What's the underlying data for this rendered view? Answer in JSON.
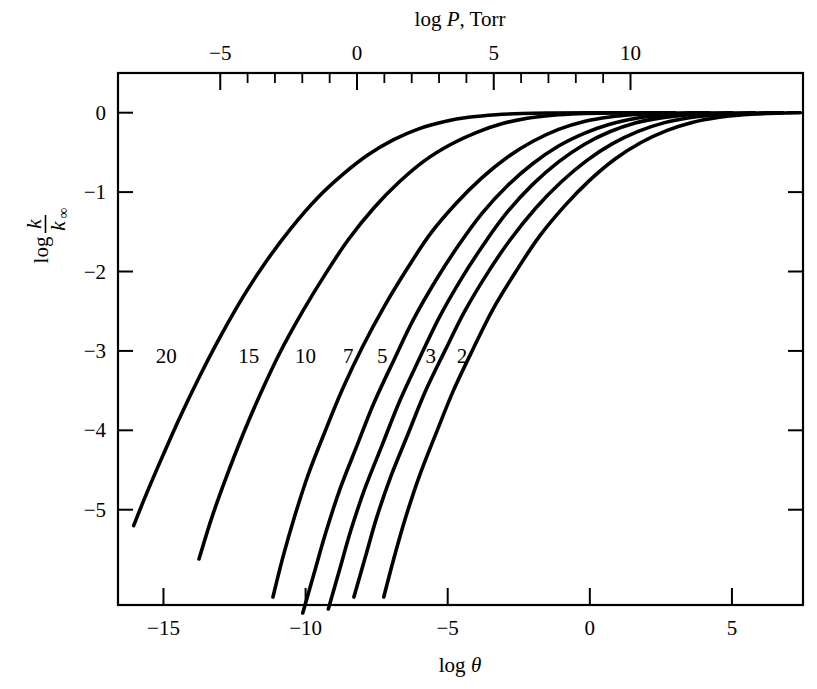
{
  "figure": {
    "background_color": "#ffffff",
    "ink_color": "#000000"
  },
  "chart_data": {
    "type": "line",
    "title": "",
    "xlabel": "log θ",
    "ylabel": "log k/k∞",
    "top_axis_label": "log P, Torr",
    "xlim": [
      -16.6,
      7.5
    ],
    "ylim": [
      -6.2,
      0.5
    ],
    "grid": false,
    "legend": "inline-curve-labels",
    "x_ticks": [
      {
        "value": -15,
        "label": "−15"
      },
      {
        "value": -10,
        "label": "−10"
      },
      {
        "value": -5,
        "label": "−5"
      },
      {
        "value": 0,
        "label": "0"
      },
      {
        "value": 5,
        "label": "5"
      }
    ],
    "y_ticks": [
      {
        "value": 0,
        "label": "0"
      },
      {
        "value": -1,
        "label": "−1"
      },
      {
        "value": -2,
        "label": "−2"
      },
      {
        "value": -3,
        "label": "−3"
      },
      {
        "value": -4,
        "label": "−4"
      },
      {
        "value": -5,
        "label": "−5"
      }
    ],
    "top_axis": {
      "label": "log P, Torr",
      "major_ticks": [
        {
          "value": -5,
          "label": "−5"
        },
        {
          "value": 0,
          "label": "0"
        },
        {
          "value": 5,
          "label": "5"
        },
        {
          "value": 10,
          "label": "10"
        }
      ],
      "minor_tick_count_between_majors": 4,
      "minor_ticks": [
        -4,
        -3,
        -2,
        -1,
        1,
        2,
        3,
        4,
        6,
        7,
        8,
        9
      ]
    },
    "series": [
      {
        "name": "20",
        "label": "20",
        "label_x": -14.9,
        "label_y": -3.15,
        "points": [
          [
            -16.05,
            -5.2
          ],
          [
            -15.6,
            -4.8
          ],
          [
            -15.0,
            -4.3
          ],
          [
            -14.4,
            -3.82
          ],
          [
            -13.7,
            -3.3
          ],
          [
            -13.0,
            -2.82
          ],
          [
            -12.2,
            -2.32
          ],
          [
            -11.4,
            -1.88
          ],
          [
            -10.5,
            -1.45
          ],
          [
            -9.6,
            -1.08
          ],
          [
            -8.7,
            -0.78
          ],
          [
            -7.8,
            -0.53
          ],
          [
            -6.9,
            -0.34
          ],
          [
            -6.0,
            -0.2
          ],
          [
            -5.1,
            -0.11
          ],
          [
            -4.2,
            -0.055
          ],
          [
            -3.3,
            -0.025
          ],
          [
            -2.4,
            -0.01
          ],
          [
            -1.5,
            -0.004
          ],
          [
            0.0,
            -0.001
          ],
          [
            3.0,
            0.0
          ]
        ]
      },
      {
        "name": "15",
        "label": "15",
        "label_x": -12.0,
        "label_y": -3.15,
        "points": [
          [
            -13.75,
            -5.62
          ],
          [
            -13.3,
            -5.1
          ],
          [
            -12.8,
            -4.6
          ],
          [
            -12.2,
            -4.05
          ],
          [
            -11.6,
            -3.55
          ],
          [
            -10.9,
            -3.02
          ],
          [
            -10.1,
            -2.5
          ],
          [
            -9.3,
            -2.03
          ],
          [
            -8.5,
            -1.6
          ],
          [
            -7.6,
            -1.2
          ],
          [
            -6.7,
            -0.87
          ],
          [
            -5.8,
            -0.6
          ],
          [
            -4.9,
            -0.4
          ],
          [
            -4.0,
            -0.25
          ],
          [
            -3.1,
            -0.14
          ],
          [
            -2.2,
            -0.07
          ],
          [
            -1.3,
            -0.032
          ],
          [
            -0.4,
            -0.013
          ],
          [
            0.8,
            -0.004
          ],
          [
            2.0,
            -0.001
          ],
          [
            3.0,
            0.0
          ]
        ]
      },
      {
        "name": "10",
        "label": "10",
        "label_x": -10.0,
        "label_y": -3.15,
        "points": [
          [
            -11.15,
            -6.1
          ],
          [
            -10.8,
            -5.6
          ],
          [
            -10.4,
            -5.1
          ],
          [
            -9.9,
            -4.55
          ],
          [
            -9.3,
            -4.0
          ],
          [
            -8.7,
            -3.48
          ],
          [
            -8.0,
            -2.95
          ],
          [
            -7.2,
            -2.42
          ],
          [
            -6.4,
            -1.95
          ],
          [
            -5.6,
            -1.52
          ],
          [
            -4.7,
            -1.14
          ],
          [
            -3.8,
            -0.82
          ],
          [
            -2.9,
            -0.56
          ],
          [
            -2.0,
            -0.36
          ],
          [
            -1.1,
            -0.21
          ],
          [
            -0.2,
            -0.11
          ],
          [
            0.7,
            -0.053
          ],
          [
            1.6,
            -0.023
          ],
          [
            2.5,
            -0.009
          ],
          [
            3.5,
            -0.002
          ],
          [
            4.2,
            0.0
          ]
        ]
      },
      {
        "name": "7",
        "label": "7",
        "label_x": -8.5,
        "label_y": -3.15,
        "points": [
          [
            -10.1,
            -6.3
          ],
          [
            -9.7,
            -5.8
          ],
          [
            -9.3,
            -5.3
          ],
          [
            -8.8,
            -4.75
          ],
          [
            -8.2,
            -4.2
          ],
          [
            -7.6,
            -3.66
          ],
          [
            -6.9,
            -3.12
          ],
          [
            -6.2,
            -2.6
          ],
          [
            -5.4,
            -2.1
          ],
          [
            -4.6,
            -1.66
          ],
          [
            -3.8,
            -1.27
          ],
          [
            -2.9,
            -0.92
          ],
          [
            -2.0,
            -0.64
          ],
          [
            -1.1,
            -0.42
          ],
          [
            -0.2,
            -0.26
          ],
          [
            0.7,
            -0.145
          ],
          [
            1.6,
            -0.073
          ],
          [
            2.5,
            -0.033
          ],
          [
            3.4,
            -0.013
          ],
          [
            4.3,
            -0.004
          ],
          [
            5.0,
            0.0
          ]
        ]
      },
      {
        "name": "5",
        "label": "5",
        "label_x": -7.3,
        "label_y": -3.15,
        "points": [
          [
            -9.2,
            -6.25
          ],
          [
            -8.8,
            -5.75
          ],
          [
            -8.4,
            -5.25
          ],
          [
            -7.9,
            -4.72
          ],
          [
            -7.3,
            -4.18
          ],
          [
            -6.7,
            -3.64
          ],
          [
            -6.0,
            -3.1
          ],
          [
            -5.3,
            -2.58
          ],
          [
            -4.5,
            -2.08
          ],
          [
            -3.7,
            -1.64
          ],
          [
            -2.9,
            -1.25
          ],
          [
            -2.0,
            -0.9
          ],
          [
            -1.1,
            -0.62
          ],
          [
            -0.2,
            -0.4
          ],
          [
            0.7,
            -0.24
          ],
          [
            1.6,
            -0.13
          ],
          [
            2.5,
            -0.065
          ],
          [
            3.4,
            -0.028
          ],
          [
            4.3,
            -0.01
          ],
          [
            5.2,
            -0.003
          ],
          [
            5.8,
            0.0
          ]
        ]
      },
      {
        "name": "3",
        "label": "3",
        "label_x": -5.6,
        "label_y": -3.15,
        "points": [
          [
            -8.3,
            -6.1
          ],
          [
            -7.9,
            -5.6
          ],
          [
            -7.5,
            -5.1
          ],
          [
            -7.0,
            -4.58
          ],
          [
            -6.4,
            -4.05
          ],
          [
            -5.8,
            -3.52
          ],
          [
            -5.1,
            -3.0
          ],
          [
            -4.4,
            -2.5
          ],
          [
            -3.6,
            -2.02
          ],
          [
            -2.8,
            -1.6
          ],
          [
            -1.9,
            -1.2
          ],
          [
            -1.0,
            -0.87
          ],
          [
            -0.1,
            -0.6
          ],
          [
            0.8,
            -0.39
          ],
          [
            1.7,
            -0.235
          ],
          [
            2.6,
            -0.128
          ],
          [
            3.5,
            -0.063
          ],
          [
            4.4,
            -0.027
          ],
          [
            5.3,
            -0.01
          ],
          [
            6.2,
            -0.002
          ],
          [
            6.8,
            0.0
          ]
        ]
      },
      {
        "name": "2",
        "label": "2",
        "label_x": -4.5,
        "label_y": -3.15,
        "points": [
          [
            -7.25,
            -6.1
          ],
          [
            -6.9,
            -5.62
          ],
          [
            -6.5,
            -5.12
          ],
          [
            -6.0,
            -4.58
          ],
          [
            -5.4,
            -4.03
          ],
          [
            -4.8,
            -3.5
          ],
          [
            -4.1,
            -2.97
          ],
          [
            -3.4,
            -2.47
          ],
          [
            -2.6,
            -2.0
          ],
          [
            -1.8,
            -1.57
          ],
          [
            -0.9,
            -1.18
          ],
          [
            0.0,
            -0.85
          ],
          [
            0.9,
            -0.58
          ],
          [
            1.8,
            -0.375
          ],
          [
            2.7,
            -0.225
          ],
          [
            3.6,
            -0.122
          ],
          [
            4.5,
            -0.06
          ],
          [
            5.4,
            -0.026
          ],
          [
            6.3,
            -0.009
          ],
          [
            7.0,
            -0.002
          ],
          [
            7.4,
            0.0
          ]
        ]
      }
    ]
  }
}
